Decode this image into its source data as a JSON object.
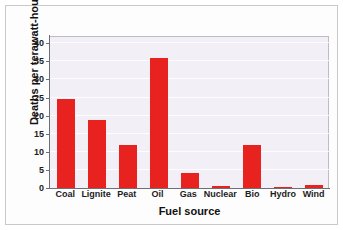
{
  "chart_data": {
    "type": "bar",
    "title": "",
    "xlabel": "Fuel source",
    "ylabel": "Deaths per terawatt-hour",
    "categories": [
      "Coal",
      "Lignite",
      "Peat",
      "Oil",
      "Gas",
      "Nuclear",
      "Bio",
      "Hydro",
      "Wind"
    ],
    "values": [
      24.6,
      18.7,
      12.0,
      36.0,
      4.2,
      0.5,
      12.0,
      0.3,
      0.7
    ],
    "ylim": [
      0,
      42
    ],
    "yticks": [
      0,
      5,
      10,
      15,
      20,
      25,
      30,
      35,
      40
    ],
    "ytick_labels": [
      "0",
      "5",
      "10",
      "15",
      "20",
      "25",
      "30",
      "35",
      "40"
    ],
    "grid": true,
    "legend": "none",
    "bar_color": "#e8221f",
    "plot_background": "#f2f0f6"
  }
}
